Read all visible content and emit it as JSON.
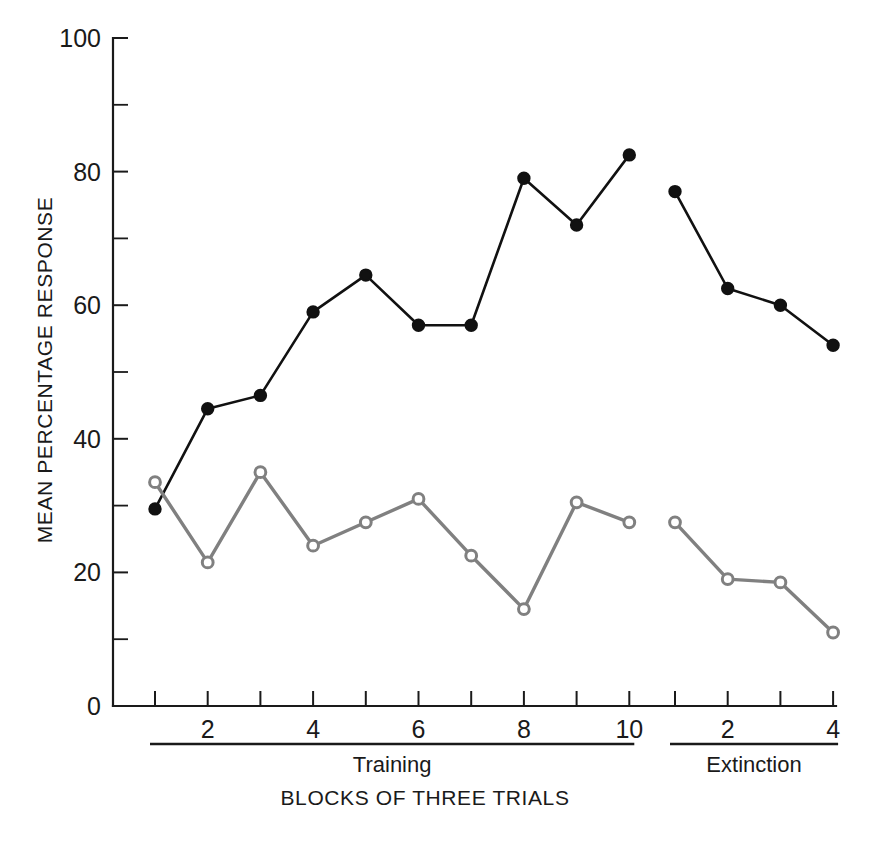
{
  "chart_data": {
    "type": "line",
    "title": "",
    "xlabel": "BLOCKS OF THREE TRIALS",
    "ylabel": "MEAN PERCENTAGE RESPONSE",
    "ylim": [
      0,
      100
    ],
    "y_ticks_major": [
      0,
      20,
      40,
      60,
      80,
      100
    ],
    "y_ticklabels": [
      "0",
      "20",
      "40",
      "60",
      "80",
      "100"
    ],
    "y_ticks_minor": [
      10,
      30,
      50,
      70,
      90
    ],
    "grid": false,
    "legend": "none",
    "phases": [
      {
        "name": "Training",
        "x": [
          1,
          2,
          3,
          4,
          5,
          6,
          7,
          8,
          9,
          10
        ],
        "x_ticklabels": [
          "",
          "2",
          "",
          "4",
          "",
          "6",
          "",
          "8",
          "",
          "10"
        ]
      },
      {
        "name": "Extinction",
        "x": [
          1,
          2,
          3,
          4
        ],
        "x_ticklabels": [
          "",
          "2",
          "",
          "4"
        ]
      }
    ],
    "series": [
      {
        "name": "filled-circles",
        "marker": "filled-circle",
        "color": "#111111",
        "training_values": [
          29.5,
          44.5,
          46.5,
          59.0,
          64.5,
          57.0,
          57.0,
          79.0,
          72.0,
          82.5
        ],
        "extinction_values": [
          77.0,
          62.5,
          60.0,
          54.0
        ]
      },
      {
        "name": "open-circles",
        "marker": "open-circle",
        "color": "#808080",
        "training_values": [
          33.5,
          21.5,
          35.0,
          24.0,
          27.5,
          31.0,
          22.5,
          14.5,
          30.5,
          27.5
        ],
        "extinction_values": [
          27.5,
          19.0,
          18.5,
          11.0
        ]
      }
    ]
  },
  "figure": {
    "background": "#ffffff",
    "axis_color": "#1a1a1a"
  }
}
